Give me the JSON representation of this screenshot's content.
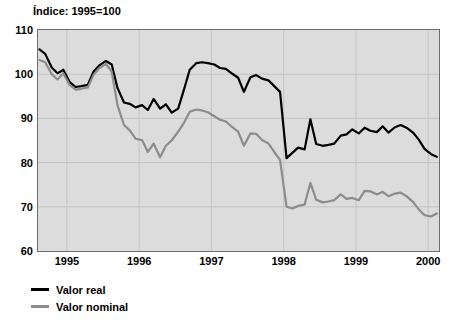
{
  "chart_data": {
    "type": "line",
    "title": "Índice: 1995=100",
    "xlabel": "",
    "ylabel": "",
    "ylim": [
      60,
      110
    ],
    "yticks": [
      60,
      70,
      80,
      90,
      100,
      110
    ],
    "xlim": [
      1994.6,
      2000.15
    ],
    "xticks": [
      1995,
      1996,
      1997,
      1998,
      1999,
      2000
    ],
    "xtick_labels": [
      "1995",
      "1996",
      "1997",
      "1998",
      "1999",
      "2000"
    ],
    "grid": true,
    "legend_position": "below-left",
    "plot_background": "#dcdcdc",
    "series": [
      {
        "name": "Valor real",
        "color": "#000000",
        "x": [
          1994.62,
          1994.7,
          1994.79,
          1994.87,
          1994.95,
          1995.04,
          1995.12,
          1995.2,
          1995.29,
          1995.37,
          1995.45,
          1995.54,
          1995.62,
          1995.7,
          1995.79,
          1995.87,
          1995.95,
          1996.04,
          1996.12,
          1996.2,
          1996.29,
          1996.37,
          1996.45,
          1996.54,
          1996.62,
          1996.7,
          1996.79,
          1996.87,
          1996.95,
          1997.04,
          1997.12,
          1997.2,
          1997.29,
          1997.37,
          1997.45,
          1997.54,
          1997.62,
          1997.7,
          1997.79,
          1997.87,
          1997.95,
          1998.04,
          1998.12,
          1998.2,
          1998.29,
          1998.37,
          1998.45,
          1998.54,
          1998.62,
          1998.7,
          1998.79,
          1998.87,
          1998.95,
          1999.04,
          1999.12,
          1999.2,
          1999.29,
          1999.37,
          1999.45,
          1999.54,
          1999.62,
          1999.7,
          1999.79,
          1999.87,
          1999.95,
          2000.04,
          2000.12
        ],
        "values": [
          105.6,
          104.6,
          101.5,
          100.2,
          101.0,
          98.2,
          97.1,
          97.3,
          97.6,
          100.6,
          102.0,
          103.0,
          102.2,
          96.9,
          93.6,
          93.3,
          92.5,
          93.0,
          91.9,
          94.4,
          92.2,
          93.2,
          91.3,
          92.2,
          96.5,
          101.0,
          102.5,
          102.7,
          102.5,
          102.2,
          101.4,
          101.2,
          100.1,
          99.2,
          96.0,
          99.3,
          99.8,
          99.0,
          98.6,
          97.3,
          96.0,
          81.0,
          82.2,
          83.4,
          83.0,
          89.8,
          84.2,
          83.8,
          84.0,
          84.3,
          86.1,
          86.4,
          87.5,
          86.6,
          87.9,
          87.2,
          86.9,
          88.2,
          86.8,
          88.0,
          88.5,
          87.9,
          86.8,
          85.2,
          83.1,
          81.9,
          81.3
        ]
      },
      {
        "name": "Valor nominal",
        "color": "#8c8c8c",
        "x": [
          1994.62,
          1994.7,
          1994.79,
          1994.87,
          1994.95,
          1995.04,
          1995.12,
          1995.2,
          1995.29,
          1995.37,
          1995.45,
          1995.54,
          1995.62,
          1995.7,
          1995.79,
          1995.87,
          1995.95,
          1996.04,
          1996.12,
          1996.2,
          1996.29,
          1996.37,
          1996.45,
          1996.54,
          1996.62,
          1996.7,
          1996.79,
          1996.87,
          1996.95,
          1997.04,
          1997.12,
          1997.2,
          1997.29,
          1997.37,
          1997.45,
          1997.54,
          1997.62,
          1997.7,
          1997.79,
          1997.87,
          1997.95,
          1998.04,
          1998.12,
          1998.2,
          1998.29,
          1998.37,
          1998.45,
          1998.54,
          1998.62,
          1998.7,
          1998.79,
          1998.87,
          1998.95,
          1999.04,
          1999.12,
          1999.2,
          1999.29,
          1999.37,
          1999.45,
          1999.54,
          1999.62,
          1999.7,
          1999.79,
          1999.87,
          1999.95,
          2000.04,
          2000.12
        ],
        "values": [
          103.2,
          102.7,
          100.0,
          98.8,
          100.2,
          97.5,
          96.5,
          96.7,
          97.0,
          99.9,
          101.4,
          102.3,
          100.6,
          93.0,
          88.5,
          87.3,
          85.4,
          85.1,
          82.4,
          84.3,
          81.2,
          83.8,
          85.0,
          87.0,
          89.0,
          91.5,
          92.0,
          91.8,
          91.4,
          90.5,
          89.7,
          89.3,
          88.0,
          87.0,
          83.8,
          86.6,
          86.5,
          85.1,
          84.3,
          82.4,
          80.6,
          70.0,
          69.6,
          70.2,
          70.5,
          75.4,
          71.6,
          71.0,
          71.2,
          71.5,
          72.8,
          71.8,
          72.0,
          71.5,
          73.6,
          73.5,
          72.8,
          73.4,
          72.4,
          73.0,
          73.2,
          72.4,
          71.1,
          69.4,
          68.1,
          67.8,
          68.5
        ]
      }
    ]
  },
  "legend": {
    "items": [
      {
        "label": "Valor real",
        "color": "#000000"
      },
      {
        "label": "Valor nominal",
        "color": "#8c8c8c"
      }
    ]
  }
}
